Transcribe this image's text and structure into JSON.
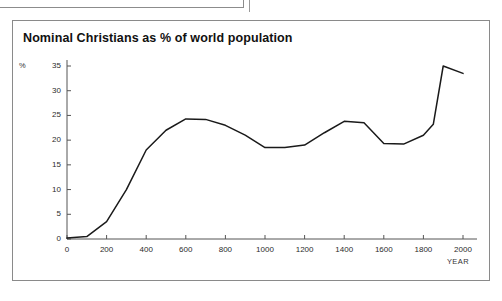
{
  "panel": {
    "title": "Nominal Christians as % of world population"
  },
  "chart_data": {
    "type": "line",
    "title": "Nominal Christians as % of world population",
    "xlabel": "YEAR",
    "ylabel": "%",
    "x": [
      0,
      100,
      200,
      300,
      400,
      500,
      600,
      700,
      800,
      900,
      1000,
      1100,
      1200,
      1300,
      1400,
      1500,
      1600,
      1700,
      1800,
      1850,
      1900,
      2000
    ],
    "values": [
      0.2,
      0.5,
      3.5,
      10.0,
      18.0,
      22.0,
      24.3,
      24.2,
      23.0,
      21.0,
      18.5,
      18.5,
      19.0,
      21.5,
      23.8,
      23.5,
      19.3,
      19.2,
      21.0,
      23.2,
      35.0,
      33.5
    ],
    "series": [
      {
        "name": "Nominal Christians as % of world population",
        "values": [
          0.2,
          0.5,
          3.5,
          10.0,
          18.0,
          22.0,
          24.3,
          24.2,
          23.0,
          21.0,
          18.5,
          18.5,
          19.0,
          21.5,
          23.8,
          23.5,
          19.3,
          19.2,
          21.0,
          23.2,
          35.0,
          33.5
        ]
      }
    ],
    "xlim": [
      0,
      2000
    ],
    "ylim": [
      0,
      35
    ],
    "xticks": [
      "0",
      "200",
      "400",
      "600",
      "800",
      "1000",
      "1200",
      "1400",
      "1600",
      "1800",
      "2000"
    ],
    "xtick_values": [
      0,
      200,
      400,
      600,
      800,
      1000,
      1200,
      1400,
      1600,
      1800,
      2000
    ],
    "yticks": [
      "0",
      "5",
      "10",
      "15",
      "20",
      "25",
      "30",
      "35"
    ],
    "ytick_values": [
      0,
      5,
      10,
      15,
      20,
      25,
      30,
      35
    ],
    "grid": false,
    "legend": "none",
    "line_color": "#1a1a1a",
    "axis_color": "#555555",
    "background_color": "#ffffff",
    "border_color": "#8a8a8a"
  }
}
